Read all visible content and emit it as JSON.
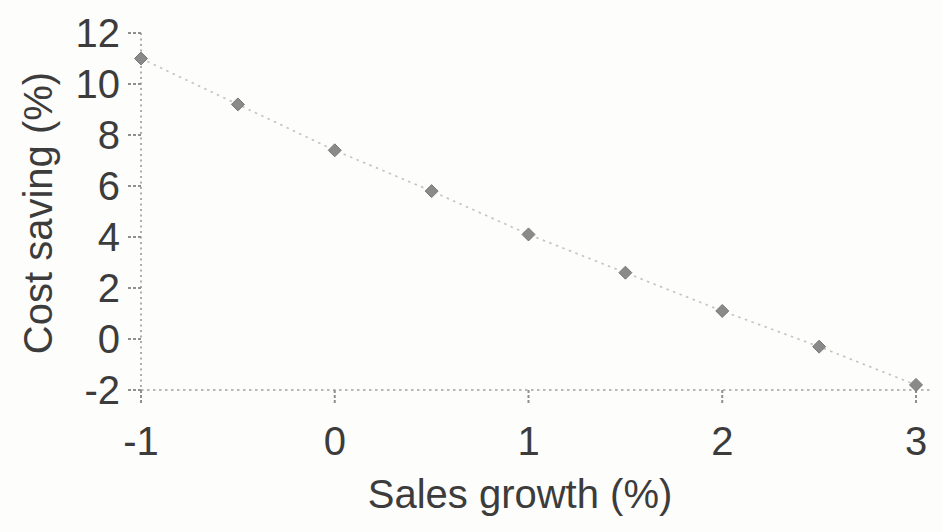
{
  "chart_data": {
    "type": "line",
    "x": [
      -1,
      -0.5,
      0,
      0.5,
      1,
      1.5,
      2,
      2.5,
      3
    ],
    "y": [
      11,
      9.2,
      7.4,
      5.8,
      4.1,
      2.6,
      1.1,
      -0.3,
      -1.8
    ],
    "title": "",
    "xlabel": "Sales growth (%)",
    "ylabel": "Cost saving (%)",
    "xlim": [
      -1,
      3
    ],
    "ylim": [
      -2,
      12
    ],
    "x_tick_labels": [
      "-1",
      "0",
      "1",
      "2",
      "3"
    ],
    "x_tick_values": [
      -1,
      0,
      1,
      2,
      3
    ],
    "y_tick_labels": [
      "-2",
      "0",
      "2",
      "4",
      "6",
      "8",
      "10",
      "12"
    ],
    "y_tick_values": [
      -2,
      0,
      2,
      4,
      6,
      8,
      10,
      12
    ],
    "grid": false,
    "legend_position": "none",
    "marker": "diamond",
    "line_style": "dotted",
    "colors": {
      "marker": "#8a8a8a",
      "marker_edge": "#787878",
      "line": "#c4c4c4",
      "axis": "#a0a0a0",
      "tick": "#8f8f8f",
      "text": "#3c3c3c",
      "background": "#fdfdfb"
    }
  }
}
